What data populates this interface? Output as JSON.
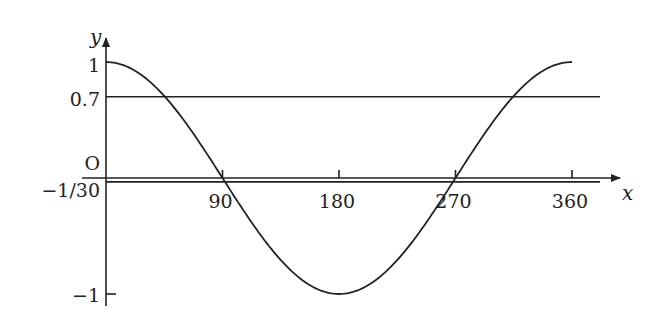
{
  "chart_data": {
    "type": "line",
    "title": "",
    "xlabel": "x",
    "ylabel": "y",
    "origin_label": "O",
    "xlim": [
      0,
      360
    ],
    "ylim": [
      -1,
      1
    ],
    "x_ticks": [
      {
        "value": 90,
        "label": "90"
      },
      {
        "value": 180,
        "label": "180"
      },
      {
        "value": 270,
        "label": "270"
      },
      {
        "value": 360,
        "label": "360"
      }
    ],
    "y_ticks": [
      {
        "value": 1,
        "label": "1"
      },
      {
        "value": 0.7,
        "label": "0.7"
      },
      {
        "value": -0.0333,
        "label": "−1/30"
      },
      {
        "value": -1,
        "label": "−1"
      }
    ],
    "series": [
      {
        "name": "y = cos x",
        "function": "cos",
        "x_range": [
          0,
          360
        ],
        "color": "#222222"
      }
    ],
    "reference_lines": [
      {
        "name": "y = 0.7",
        "y": 0.7
      },
      {
        "name": "y = -1/30",
        "y": -0.0333
      }
    ],
    "grid": false,
    "legend": "none"
  }
}
